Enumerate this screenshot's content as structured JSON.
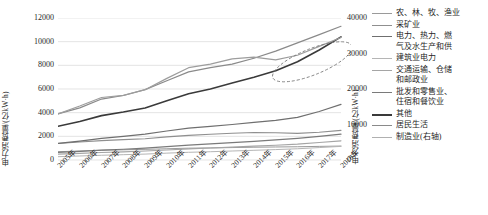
{
  "chart_data": {
    "type": "line",
    "title": "",
    "xlabel": "",
    "ylabel": "电力消费量/(亿kW·h)",
    "ylabel_right": "电力消费量/(亿kW·h)",
    "categories": [
      "2005年",
      "2006年",
      "2007年",
      "2008年",
      "2009年",
      "2010年",
      "2011年",
      "2012年",
      "2013年",
      "2014年",
      "2015年",
      "2016年",
      "2017年",
      "2018年"
    ],
    "ylim": [
      0,
      12000
    ],
    "yticks": [
      0,
      2000,
      4000,
      6000,
      8000,
      10000,
      12000
    ],
    "ylim_right": [
      0,
      40000
    ],
    "yticks_right": [
      0,
      10000,
      20000,
      30000,
      40000
    ],
    "grid": true,
    "legend_position": "right",
    "annotations": [
      {
        "type": "ellipse",
        "label": "dashed-highlight-ellipse",
        "x_range": [
          "2015年",
          "2018年"
        ],
        "note": "虚线椭圆标注收敛区间"
      }
    ],
    "series": [
      {
        "name": "农、林、牧、渔业",
        "axis": "left",
        "color": "#9a9a9a",
        "width": 1.0,
        "values": [
          700,
          760,
          820,
          860,
          900,
          950,
          1000,
          1020,
          1050,
          1080,
          1100,
          1120,
          1150,
          1180
        ]
      },
      {
        "name": "采矿业",
        "axis": "left",
        "color": "#8f8f8f",
        "width": 1.1,
        "values": [
          1400,
          1520,
          1640,
          1720,
          1800,
          1950,
          2080,
          2180,
          2260,
          2320,
          2300,
          2250,
          2350,
          2500
        ]
      },
      {
        "name": "电力、热力、燃气及水生产和供应业",
        "axis": "left",
        "color": "#6f6f6f",
        "width": 1.2,
        "values": [
          1400,
          1600,
          1830,
          2000,
          2180,
          2450,
          2700,
          2850,
          3000,
          3180,
          3350,
          3600,
          4100,
          4700
        ]
      },
      {
        "name": "建筑业电力",
        "axis": "left",
        "color": "#b5b5b5",
        "width": 1.0,
        "values": [
          280,
          340,
          400,
          450,
          500,
          580,
          650,
          700,
          760,
          820,
          880,
          950,
          1050,
          1150
        ]
      },
      {
        "name": "交通运输、仓储和邮政业",
        "axis": "left",
        "color": "#a5a5a5",
        "width": 1.1,
        "values": [
          500,
          560,
          630,
          690,
          760,
          850,
          940,
          1010,
          1090,
          1170,
          1250,
          1340,
          1480,
          1620
        ]
      },
      {
        "name": "批发和零售业、住宿和餐饮业",
        "axis": "left",
        "color": "#7a7a7a",
        "width": 1.2,
        "values": [
          640,
          730,
          830,
          910,
          1000,
          1130,
          1260,
          1360,
          1470,
          1580,
          1700,
          1830,
          2000,
          2180
        ]
      },
      {
        "name": "其他",
        "axis": "left",
        "color": "#3a3a3a",
        "width": 1.6,
        "values": [
          2850,
          3250,
          3750,
          4050,
          4400,
          5000,
          5600,
          6000,
          6500,
          7000,
          7550,
          8300,
          9300,
          10400
        ]
      },
      {
        "name": "居民生活",
        "axis": "left",
        "color": "#8a8a8a",
        "width": 1.2,
        "values": [
          3900,
          4400,
          5150,
          5450,
          5950,
          6700,
          7450,
          7800,
          8100,
          8600,
          9200,
          9900,
          10600,
          11300
        ]
      },
      {
        "name": "制造业(右轴)",
        "axis": "right",
        "color": "#9d9d9d",
        "width": 1.2,
        "values": [
          13000,
          15200,
          17600,
          18200,
          19800,
          23000,
          26000,
          27000,
          28500,
          29000,
          28200,
          29500,
          32000,
          34500
        ]
      }
    ]
  },
  "legend": {
    "items": [
      {
        "label": "农、林、牧、渔业",
        "color": "#9a9a9a",
        "width": 1.2
      },
      {
        "label": "采矿业",
        "color": "#8f8f8f",
        "width": 1.3
      },
      {
        "label": "电力、热力、燃\n气及水生产和供",
        "color": "#6f6f6f",
        "width": 1.5
      },
      {
        "label": "建筑业电力",
        "color": "#b5b5b5",
        "width": 1.2
      },
      {
        "label": "交通运输、仓储\n和邮政业",
        "color": "#a5a5a5",
        "width": 1.3
      },
      {
        "label": "批发和零售业、\n住宿和餐饮业",
        "color": "#7a7a7a",
        "width": 1.5
      },
      {
        "label": "其他",
        "color": "#3a3a3a",
        "width": 2.0
      },
      {
        "label": "居民生活",
        "color": "#8a8a8a",
        "width": 1.4
      },
      {
        "label": "制造业(右轴)",
        "color": "#b0b0b0",
        "width": 1.2
      }
    ]
  }
}
